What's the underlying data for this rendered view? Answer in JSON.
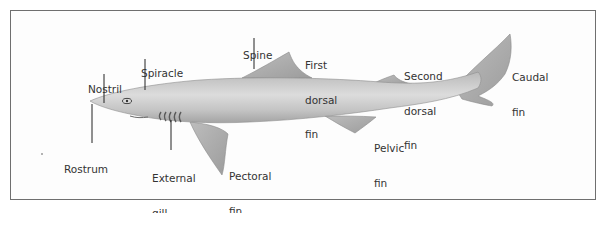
{
  "diagram": {
    "labels": {
      "nostril": [
        "Nostril"
      ],
      "spiracle": [
        "Spiracle"
      ],
      "spine": [
        "Spine"
      ],
      "first_dorsal_fin": [
        "First",
        "dorsal",
        "fin"
      ],
      "second_dorsal_fin": [
        "Second",
        "dorsal",
        "fin"
      ],
      "caudal_fin": [
        "Caudal",
        "fin"
      ],
      "rostrum": [
        "Rostrum"
      ],
      "external_gill_openings": [
        "External",
        "gill",
        "openings"
      ],
      "pectoral_fin": [
        "Pectoral",
        "fin"
      ],
      "pelvic_fin": [
        "Pelvic",
        "fin"
      ]
    },
    "colors": {
      "body": "#c9c9c9",
      "body_dark": "#a9a9a9",
      "frame": "#6f6f6f",
      "leader": "#222222"
    }
  }
}
